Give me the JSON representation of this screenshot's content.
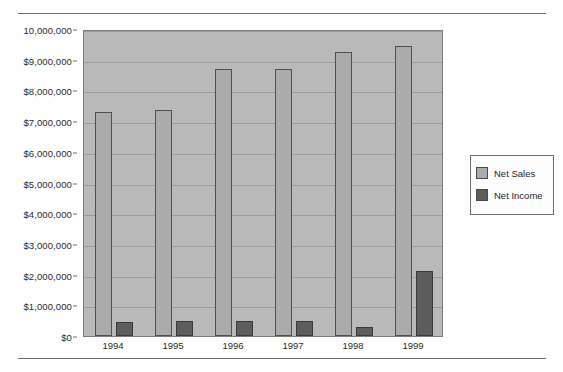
{
  "chart_data": {
    "type": "bar",
    "title": "",
    "subtitle": "",
    "xlabel": "",
    "ylabel": "",
    "categories": [
      "1994",
      "1995",
      "1996",
      "1997",
      "1998",
      "1999"
    ],
    "series": [
      {
        "name": "Net Sales",
        "color": "#ababab",
        "values": [
          7300000,
          7350000,
          8700000,
          8700000,
          9250000,
          9450000
        ]
      },
      {
        "name": "Net Income",
        "color": "#5d5d5d",
        "values": [
          450000,
          500000,
          500000,
          500000,
          280000,
          2120000
        ]
      }
    ],
    "ylim": [
      0,
      10000000
    ],
    "ytick_values": [
      0,
      1000000,
      2000000,
      3000000,
      4000000,
      5000000,
      6000000,
      7000000,
      8000000,
      9000000,
      10000000
    ],
    "ytick_labels": [
      "$0",
      "$1,000,000",
      "$2,000,000",
      "$3,000,000",
      "$4,000,000",
      "$5,000,000",
      "$6,000,000",
      "$7,000,000",
      "$8,000,000",
      "$9,000,000",
      "10,000,000"
    ],
    "grid": true,
    "grid_axis": "y",
    "legend_position": "right",
    "legend_entries": [
      "Net Sales",
      "Net Income"
    ],
    "plot_background": "#b9b9b9",
    "annotations": []
  }
}
